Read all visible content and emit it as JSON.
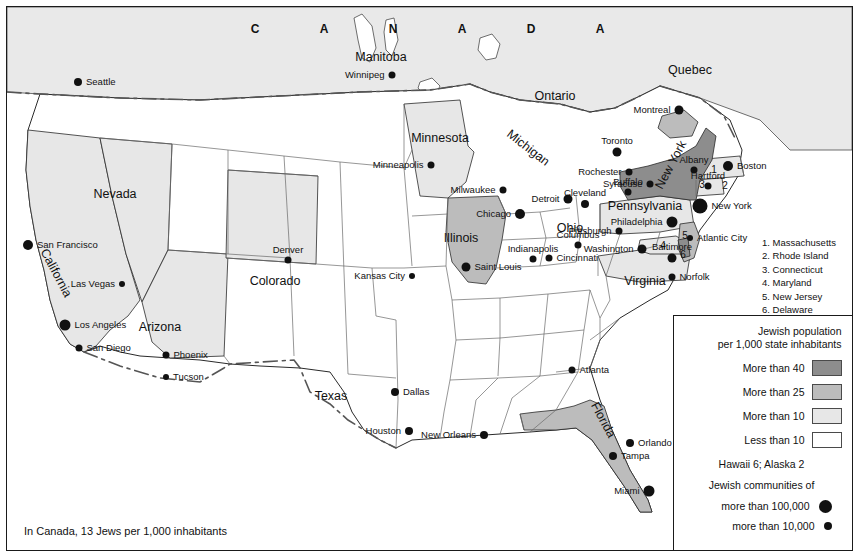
{
  "map": {
    "title_region": "United States Jewish population map",
    "caption": "In Canada, 13 Jews per 1,000 inhabitants",
    "canada_label": "CANADA"
  },
  "legend": {
    "title_line1": "Jewish population",
    "title_line2": "per 1,000 state inhabitants",
    "classes": [
      {
        "label": "More than 40",
        "color": "#8d8d8d"
      },
      {
        "label": "More than 25",
        "color": "#bcbcbc"
      },
      {
        "label": "More than 10",
        "color": "#e7e7e7"
      },
      {
        "label": "Less than 10",
        "color": "#ffffff"
      }
    ],
    "note": "Hawaii 6; Alaska 2",
    "communities_title": "Jewish communities of",
    "communities": [
      {
        "label": "more than 100,000",
        "size": 13
      },
      {
        "label": "more than 10,000",
        "size": 8
      }
    ]
  },
  "state_list": [
    "1. Massachusetts",
    "2. Rhode Island",
    "3. Connecticut",
    "4. Maryland",
    "5. New Jersey",
    "6. Delaware"
  ],
  "state_labels": [
    {
      "name": "Minnesota",
      "x": 440,
      "y": 138,
      "rot": 0
    },
    {
      "name": "Michigan",
      "x": 528,
      "y": 148,
      "rot": 38
    },
    {
      "name": "Illinois",
      "x": 461,
      "y": 238,
      "rot": 0
    },
    {
      "name": "Ohio",
      "x": 570,
      "y": 228,
      "rot": 0
    },
    {
      "name": "Nevada",
      "x": 115,
      "y": 194,
      "rot": 0
    },
    {
      "name": "California",
      "x": 56,
      "y": 273,
      "rot": 62
    },
    {
      "name": "Arizona",
      "x": 160,
      "y": 327,
      "rot": 0
    },
    {
      "name": "Colorado",
      "x": 275,
      "y": 281,
      "rot": 0
    },
    {
      "name": "Texas",
      "x": 331,
      "y": 396,
      "rot": 0
    },
    {
      "name": "Florida",
      "x": 603,
      "y": 420,
      "rot": 62
    },
    {
      "name": "Virginia",
      "x": 645,
      "y": 281,
      "rot": 0
    },
    {
      "name": "New York",
      "x": 671,
      "y": 165,
      "rot": -62
    },
    {
      "name": "Pennsylvania",
      "x": 645,
      "y": 206,
      "rot": 0
    }
  ],
  "province_labels": [
    {
      "name": "Manitoba",
      "x": 381,
      "y": 57
    },
    {
      "name": "Ontario",
      "x": 555,
      "y": 96
    },
    {
      "name": "Quebec",
      "x": 690,
      "y": 70
    }
  ],
  "numbered_markers": [
    {
      "n": "1",
      "x": 714,
      "y": 170
    },
    {
      "n": "2",
      "x": 725,
      "y": 186
    },
    {
      "n": "3",
      "x": 702,
      "y": 185
    },
    {
      "n": "4",
      "x": 663,
      "y": 246
    },
    {
      "n": "5",
      "x": 685,
      "y": 236
    },
    {
      "n": "6",
      "x": 683,
      "y": 255
    }
  ],
  "cities": [
    {
      "name": "Seattle",
      "x": 78,
      "y": 82,
      "size": 8,
      "anchor": "right"
    },
    {
      "name": "San Francisco",
      "x": 28,
      "y": 245,
      "size": 10,
      "anchor": "right"
    },
    {
      "name": "Los Angeles",
      "x": 65,
      "y": 325,
      "size": 11,
      "anchor": "right"
    },
    {
      "name": "San Diego",
      "x": 79,
      "y": 348,
      "size": 7,
      "anchor": "right"
    },
    {
      "name": "Las Vegas",
      "x": 122,
      "y": 284,
      "size": 6,
      "anchor": "left"
    },
    {
      "name": "Phoenix",
      "x": 166,
      "y": 355,
      "size": 7,
      "anchor": "right"
    },
    {
      "name": "Tucson",
      "x": 166,
      "y": 377,
      "size": 6,
      "anchor": "right"
    },
    {
      "name": "Denver",
      "x": 288,
      "y": 260,
      "size": 7,
      "anchor": "top"
    },
    {
      "name": "Kansas City",
      "x": 412,
      "y": 276,
      "size": 6,
      "anchor": "left"
    },
    {
      "name": "Winnipeg",
      "x": 392,
      "y": 75,
      "size": 7,
      "anchor": "left"
    },
    {
      "name": "Minneapolis",
      "x": 431,
      "y": 165,
      "size": 7,
      "anchor": "left"
    },
    {
      "name": "Milwaukee",
      "x": 503,
      "y": 190,
      "size": 7,
      "anchor": "left"
    },
    {
      "name": "Chicago",
      "x": 520,
      "y": 214,
      "size": 10,
      "anchor": "left"
    },
    {
      "name": "Saint Louis",
      "x": 466,
      "y": 267,
      "size": 9,
      "anchor": "right"
    },
    {
      "name": "Indianapolis",
      "x": 533,
      "y": 259,
      "size": 7,
      "anchor": "top"
    },
    {
      "name": "Cincinnati",
      "x": 549,
      "y": 258,
      "size": 7,
      "anchor": "right"
    },
    {
      "name": "Columbus",
      "x": 578,
      "y": 245,
      "size": 7,
      "anchor": "top"
    },
    {
      "name": "Detroit",
      "x": 568,
      "y": 199,
      "size": 9,
      "anchor": "left"
    },
    {
      "name": "Cleveland",
      "x": 585,
      "y": 204,
      "size": 8,
      "anchor": "top"
    },
    {
      "name": "Toronto",
      "x": 617,
      "y": 152,
      "size": 9,
      "anchor": "top"
    },
    {
      "name": "Montreal",
      "x": 679,
      "y": 110,
      "size": 9,
      "anchor": "left"
    },
    {
      "name": "Buffalo",
      "x": 628,
      "y": 192,
      "size": 7,
      "anchor": "top"
    },
    {
      "name": "Rochester",
      "x": 629,
      "y": 172,
      "size": 7,
      "anchor": "left"
    },
    {
      "name": "Syracuse",
      "x": 650,
      "y": 184,
      "size": 7,
      "anchor": "left"
    },
    {
      "name": "Albany",
      "x": 694,
      "y": 170,
      "size": 7,
      "anchor": "top"
    },
    {
      "name": "Boston",
      "x": 728,
      "y": 166,
      "size": 10,
      "anchor": "right"
    },
    {
      "name": "Hartford",
      "x": 708,
      "y": 186,
      "size": 7,
      "anchor": "top"
    },
    {
      "name": "New York",
      "x": 700,
      "y": 206,
      "size": 15,
      "anchor": "right"
    },
    {
      "name": "Philadelphia",
      "x": 672,
      "y": 222,
      "size": 11,
      "anchor": "left"
    },
    {
      "name": "Pittsburgh",
      "x": 619,
      "y": 231,
      "size": 7,
      "anchor": "left"
    },
    {
      "name": "Atlantic City",
      "x": 690,
      "y": 238,
      "size": 6,
      "anchor": "right"
    },
    {
      "name": "Baltimore",
      "x": 672,
      "y": 258,
      "size": 9,
      "anchor": "top"
    },
    {
      "name": "Washington",
      "x": 642,
      "y": 249,
      "size": 9,
      "anchor": "left"
    },
    {
      "name": "Norfolk",
      "x": 672,
      "y": 277,
      "size": 7,
      "anchor": "right"
    },
    {
      "name": "Atlanta",
      "x": 572,
      "y": 370,
      "size": 7,
      "anchor": "right"
    },
    {
      "name": "Orlando",
      "x": 630,
      "y": 443,
      "size": 8,
      "anchor": "right"
    },
    {
      "name": "Tampa",
      "x": 613,
      "y": 456,
      "size": 8,
      "anchor": "right"
    },
    {
      "name": "Miami",
      "x": 649,
      "y": 491,
      "size": 11,
      "anchor": "left"
    },
    {
      "name": "Dallas",
      "x": 395,
      "y": 392,
      "size": 8,
      "anchor": "right"
    },
    {
      "name": "Houston",
      "x": 409,
      "y": 431,
      "size": 8,
      "anchor": "left"
    },
    {
      "name": "New Orleans",
      "x": 484,
      "y": 435,
      "size": 8,
      "anchor": "left"
    }
  ]
}
